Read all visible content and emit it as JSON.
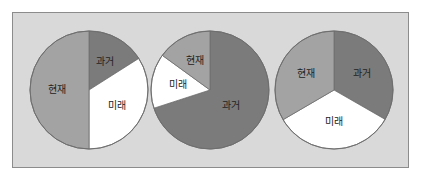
{
  "colors": {
    "past": "#7b7b7b",
    "present": "#a3a3a3",
    "future": "#ffffff",
    "panel_bg": "#d9d9d9",
    "panel_border": "#8c8c8c",
    "slice_stroke": "#6e6e6e"
  },
  "labels": {
    "past": "과거",
    "present": "현재",
    "future": "미래"
  },
  "chart_data": [
    {
      "type": "pie",
      "title": "",
      "categories": [
        "과거",
        "미래",
        "현재"
      ],
      "values": [
        16,
        34,
        50
      ],
      "start_angle": "12 o'clock, clockwise"
    },
    {
      "type": "pie",
      "title": "",
      "categories": [
        "과거",
        "미래",
        "현재"
      ],
      "values": [
        70,
        15,
        15
      ],
      "start_angle": "12 o'clock, clockwise"
    },
    {
      "type": "pie",
      "title": "",
      "categories": [
        "과거",
        "미래",
        "현재"
      ],
      "values": [
        33.3,
        33.3,
        33.4
      ],
      "start_angle": "12 o'clock, clockwise"
    }
  ]
}
